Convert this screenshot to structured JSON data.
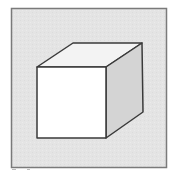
{
  "diagram": {
    "faces": [
      {
        "name": "front",
        "fill": "#ffffff"
      },
      {
        "name": "top",
        "fill": "#f3f3f3"
      },
      {
        "name": "side",
        "fill": "#d4d4d4"
      }
    ],
    "colors": {
      "background_panel": "#e3e3e3",
      "panel_border": "#7a7a7a",
      "edge_stroke": "#3a3a3a",
      "page": "#ffffff"
    }
  }
}
